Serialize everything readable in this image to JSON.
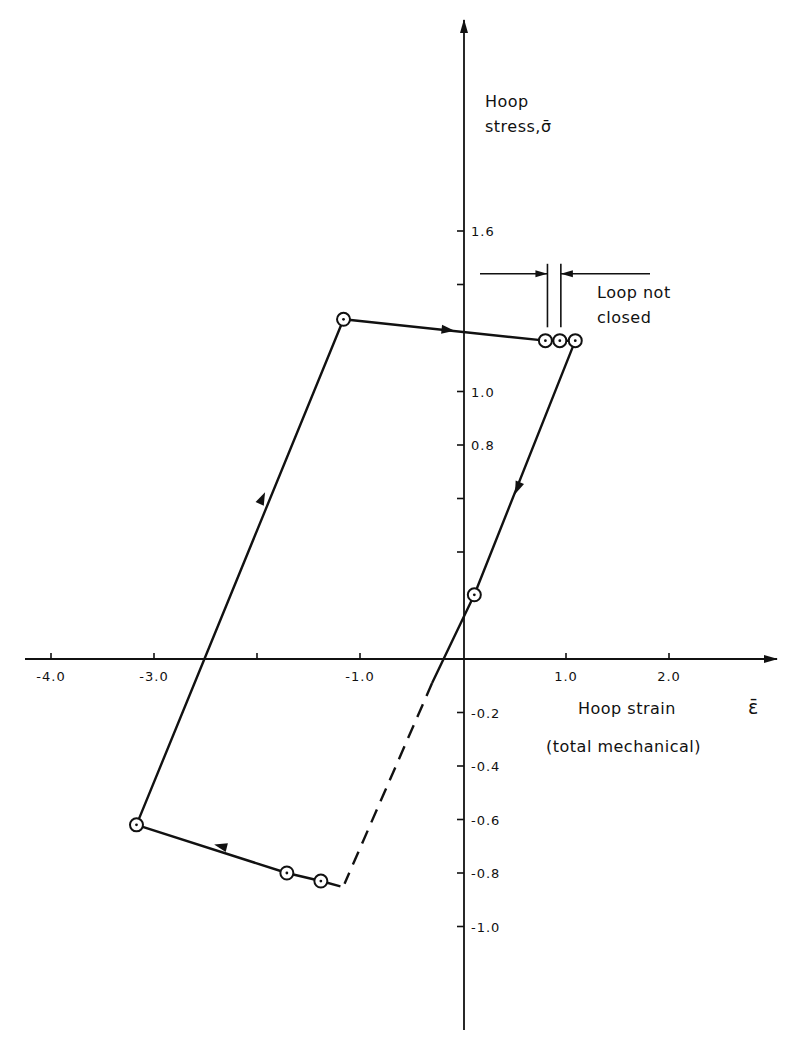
{
  "chart_data": {
    "type": "line",
    "title": "",
    "xlabel": "Hoop strain Ɛ̄",
    "xlabel_line1": "Hoop strain",
    "xlabel_symbol": "ε̄",
    "xlabel_line2": "(total mechanical)",
    "ylabel_line1": "Hoop",
    "ylabel_line2": "stress,σ̄",
    "xlim": [
      -4.4,
      3.0
    ],
    "ylim": [
      -1.4,
      2.4
    ],
    "grid": false,
    "x_ticks": [
      -4.0,
      -3.0,
      -2.0,
      -1.0,
      1.0,
      2.0
    ],
    "x_tick_labels": [
      "-4.0",
      "-3.0",
      "",
      "-1.0",
      "1.0",
      "2.0"
    ],
    "y_ticks": [
      1.6,
      1.4,
      1.0,
      0.8,
      0.6,
      0.4,
      -0.2,
      -0.4,
      -0.6,
      -0.8,
      -1.0
    ],
    "y_tick_labels": [
      "1.6",
      "",
      "1.0",
      "0.8",
      "",
      "",
      "-0.2",
      "-0.4",
      "-0.6",
      "-0.8",
      "-1.0"
    ],
    "series": [
      {
        "name": "hysteresis-loop-solid",
        "style": "solid",
        "points": [
          [
            -1.19,
            -0.85
          ],
          [
            -1.38,
            -0.83
          ],
          [
            -1.71,
            -0.8
          ],
          [
            -3.17,
            -0.62
          ],
          [
            -1.16,
            1.27
          ],
          [
            0.8,
            1.19
          ],
          [
            0.94,
            1.19
          ],
          [
            1.09,
            1.19
          ],
          [
            0.11,
            0.24
          ],
          [
            -0.3,
            -0.09
          ]
        ]
      },
      {
        "name": "hysteresis-loop-dashed",
        "style": "dashed",
        "points": [
          [
            -0.3,
            -0.09
          ],
          [
            -1.15,
            -0.84
          ]
        ]
      }
    ],
    "markers": [
      [
        -1.16,
        1.27
      ],
      [
        0.8,
        1.19
      ],
      [
        0.94,
        1.19
      ],
      [
        1.09,
        1.19
      ],
      [
        0.11,
        0.24
      ],
      [
        -3.17,
        -0.62
      ],
      [
        -1.71,
        -0.8
      ],
      [
        -1.38,
        -0.83
      ]
    ],
    "direction_arrows": [
      {
        "at": [
          -1.95,
          0.6
        ],
        "toward": [
          -1.16,
          1.27
        ]
      },
      {
        "at": [
          -0.15,
          1.23
        ],
        "toward": [
          0.8,
          1.19
        ]
      },
      {
        "at": [
          0.53,
          0.64
        ],
        "toward": [
          0.11,
          0.24
        ]
      },
      {
        "at": [
          -2.35,
          -0.7
        ],
        "toward": [
          -3.17,
          -0.62
        ]
      }
    ],
    "annotations": [
      {
        "text_line1": "Loop not",
        "text_line2": "closed",
        "gap_x": [
          0.82,
          0.95
        ],
        "y": 1.44
      }
    ]
  }
}
